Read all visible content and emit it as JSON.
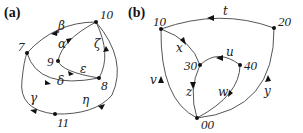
{
  "panels": [
    {
      "id": "a",
      "label": "(a)",
      "nodes": [
        {
          "id": "10",
          "label": "10"
        },
        {
          "id": "7",
          "label": "7"
        },
        {
          "id": "9",
          "label": "9"
        },
        {
          "id": "8",
          "label": "8"
        },
        {
          "id": "11",
          "label": "11"
        }
      ],
      "edges": [
        {
          "label": "β",
          "from": "10",
          "to": "7"
        },
        {
          "label": "α",
          "from": "9",
          "to": "10"
        },
        {
          "label": "ζ",
          "from": "8",
          "to": "10"
        },
        {
          "label": "ε",
          "from": "9",
          "to": "8"
        },
        {
          "label": "δ",
          "from": "7",
          "to": "8"
        },
        {
          "label": "γ",
          "from": "11",
          "to": "7"
        },
        {
          "label": "η",
          "from": "10",
          "to": "11"
        }
      ]
    },
    {
      "id": "b",
      "label": "(b)",
      "nodes": [
        {
          "id": "10",
          "label": "10"
        },
        {
          "id": "20",
          "label": "20"
        },
        {
          "id": "30",
          "label": "30"
        },
        {
          "id": "40",
          "label": "40"
        },
        {
          "id": "00",
          "label": "00"
        }
      ],
      "edges": [
        {
          "label": "t",
          "from": "20",
          "to": "10"
        },
        {
          "label": "x",
          "from": "10",
          "to": "30"
        },
        {
          "label": "u",
          "from": "40",
          "to": "30"
        },
        {
          "label": "v",
          "from": "00",
          "to": "10"
        },
        {
          "label": "z",
          "from": "30",
          "to": "00"
        },
        {
          "label": "w",
          "from": "40",
          "to": "00"
        },
        {
          "label": "y",
          "from": "00",
          "to": "20"
        }
      ]
    }
  ]
}
